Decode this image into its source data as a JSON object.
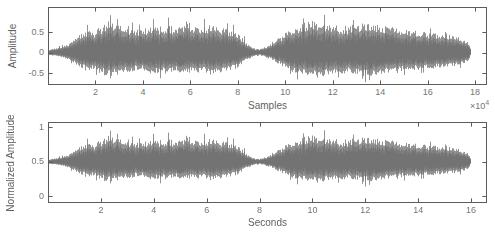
{
  "style": {
    "background": "#ffffff",
    "waveform_color": "#696969",
    "axis_color": "#5c5c5c",
    "tick_label_color": "#757575",
    "axis_label_color": "#5f5f5f",
    "seed": 1337
  },
  "chart_data": [
    {
      "type": "area",
      "chart_kind": "audio-waveform",
      "title": "",
      "xlabel": "Samples",
      "ylabel": "Amplitude",
      "x_exponent": {
        "base": "×10",
        "exponent": "4"
      },
      "xlim": [
        0,
        185000
      ],
      "xticks": {
        "values": [
          20000,
          40000,
          60000,
          80000,
          100000,
          120000,
          140000,
          160000,
          180000
        ],
        "labels": [
          "2",
          "4",
          "6",
          "8",
          "10",
          "12",
          "14",
          "16",
          "18"
        ]
      },
      "ylim": [
        -0.79,
        1.11
      ],
      "yticks": {
        "values": [
          0.5,
          0,
          -0.5
        ],
        "labels": [
          "0.5",
          "0",
          "-0.5"
        ]
      },
      "grid": false,
      "legend": null,
      "waveform": {
        "center": 0,
        "positive_scale": 1.0,
        "negative_scale": 0.8,
        "signal_end_fraction": 0.98
      }
    },
    {
      "type": "area",
      "chart_kind": "audio-waveform",
      "title": "",
      "xlabel": "Seconds",
      "ylabel": "Normalized Amplitude",
      "x_exponent": null,
      "xlim": [
        0,
        16.6
      ],
      "xticks": {
        "values": [
          2,
          4,
          6,
          8,
          10,
          12,
          14,
          16
        ],
        "labels": [
          "2",
          "4",
          "6",
          "8",
          "10",
          "12",
          "14",
          "16"
        ]
      },
      "ylim": [
        -0.1,
        1.08
      ],
      "yticks": {
        "values": [
          1,
          0.5,
          0
        ],
        "labels": [
          "1",
          "0.5",
          "0"
        ]
      },
      "grid": false,
      "legend": null,
      "waveform": {
        "center": 0.5,
        "positive_scale": 0.5,
        "negative_scale": 0.4,
        "signal_end_fraction": 0.98
      }
    }
  ],
  "waveform_envelope": {
    "description": "Shared speech/audio envelope; t = fraction of signal duration, amp = peak amplitude in top-plot units; quiet pinch near t=0.5 splits the two phrases",
    "t": [
      0,
      0.02,
      0.045,
      0.07,
      0.09,
      0.105,
      0.12,
      0.14,
      0.16,
      0.18,
      0.2,
      0.22,
      0.24,
      0.26,
      0.28,
      0.3,
      0.32,
      0.34,
      0.36,
      0.38,
      0.4,
      0.42,
      0.44,
      0.455,
      0.47,
      0.485,
      0.5,
      0.515,
      0.53,
      0.55,
      0.57,
      0.59,
      0.61,
      0.63,
      0.65,
      0.67,
      0.69,
      0.71,
      0.73,
      0.75,
      0.77,
      0.79,
      0.81,
      0.84,
      0.87,
      0.9,
      0.93,
      0.96,
      0.98,
      0.995,
      1.0
    ],
    "amp": [
      0.07,
      0.12,
      0.2,
      0.42,
      0.55,
      0.48,
      0.6,
      0.72,
      0.68,
      0.6,
      0.54,
      0.52,
      0.62,
      0.6,
      0.65,
      0.58,
      0.62,
      0.6,
      0.57,
      0.65,
      0.6,
      0.55,
      0.5,
      0.38,
      0.22,
      0.1,
      0.08,
      0.14,
      0.22,
      0.38,
      0.52,
      0.62,
      0.72,
      0.75,
      0.7,
      0.66,
      0.62,
      0.62,
      0.68,
      0.7,
      0.66,
      0.62,
      0.6,
      0.56,
      0.52,
      0.48,
      0.45,
      0.4,
      0.34,
      0.25,
      0.1
    ]
  }
}
